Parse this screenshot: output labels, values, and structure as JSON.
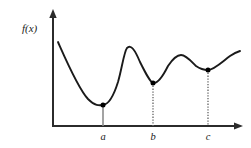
{
  "figure": {
    "background_color": "#ffffff",
    "axis_color": "#2b2b2b",
    "curve_color": "#1a1a1a",
    "marker_color": "#000000",
    "dropline_color": "#8c8c8c",
    "y_axis_label": "f(x)",
    "x_tick_labels": [
      "a",
      "b",
      "c"
    ]
  },
  "chart_data": {
    "type": "line",
    "title": "",
    "xlabel": "",
    "ylabel": "f(x)",
    "grid": false,
    "legend": "none",
    "axes": {
      "x_axis": {
        "arrow": true,
        "origin_px": 53,
        "end_px": 243,
        "baseline_px": 126
      },
      "y_axis": {
        "arrow": true,
        "top_px": 10,
        "bottom_px": 126,
        "x_px": 53
      }
    },
    "xlim": [
      0,
      10
    ],
    "ylim": [
      0,
      10
    ],
    "x_ticks": [
      {
        "label": "a",
        "x": 2.63,
        "px": 103
      },
      {
        "label": "b",
        "x": 5.26,
        "px": 153
      },
      {
        "label": "c",
        "x": 8.16,
        "px": 208
      }
    ],
    "annotations": [
      {
        "text": "f(x)",
        "role": "axis-label",
        "px": 22,
        "py": 28
      }
    ],
    "series": [
      {
        "name": "f",
        "marked_points": [
          {
            "label": "a",
            "kind": "local-minimum",
            "x": 2.63,
            "y": 1.76,
            "px": 103,
            "py": 105
          },
          {
            "label": "b",
            "kind": "local-minimum",
            "x": 5.26,
            "y": 3.71,
            "px": 153,
            "py": 83
          },
          {
            "label": "c",
            "kind": "local-minimum",
            "x": 8.16,
            "y": 4.83,
            "px": 208,
            "py": 70
          }
        ],
        "local_maxima": [
          {
            "kind": "local-maximum",
            "x": 3.89,
            "y": 6.84,
            "px": 127,
            "py": 48
          },
          {
            "kind": "local-maximum",
            "x": 6.74,
            "y": 6.22,
            "px": 181,
            "py": 55
          }
        ],
        "endpoints": [
          {
            "kind": "start",
            "x": 0.26,
            "y": 7.37,
            "px": 58,
            "py": 42
          },
          {
            "kind": "end",
            "x": 9.84,
            "y": 6.58,
            "px": 240,
            "py": 51
          }
        ],
        "path_px": "M58,42 C66,60 78,88 88,99 C95,106 99,105.5 103,105 C108,104.5 113,98 118,82 C122,68 124,52 127,48 C131,44 135,50 140,62 C146,74 150,82 153,83 C158,84 163,76 168,66 C174,57 178,55 181,55 C186,55 191,61 196,66 C201,69.5 205,70 208,70 C214,70 222,62 230,56 C234,53 237,52 240,51"
      }
    ],
    "droplines": [
      {
        "label": "a",
        "style": "solid",
        "px": 103,
        "from_py": 105,
        "to_py": 126
      },
      {
        "label": "b",
        "style": "dotted",
        "px": 153,
        "from_py": 83,
        "to_py": 126
      },
      {
        "label": "c",
        "style": "dotted",
        "px": 208,
        "from_py": 70,
        "to_py": 126
      }
    ]
  }
}
